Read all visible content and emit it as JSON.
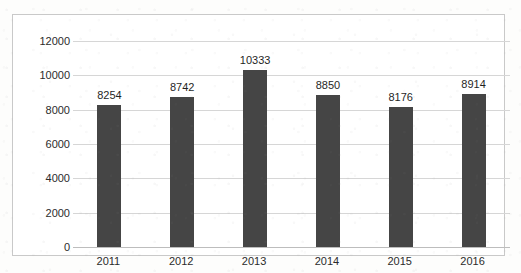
{
  "chart_data": {
    "type": "bar",
    "title": "",
    "subtitle": "",
    "xlabel": "",
    "ylabel": "",
    "categories": [
      "2011",
      "2012",
      "2013",
      "2014",
      "2015",
      "2016"
    ],
    "values": [
      8254,
      8742,
      10333,
      8850,
      8176,
      8914
    ],
    "series": [
      {
        "name": "",
        "values": [
          8254,
          8742,
          10333,
          8850,
          8176,
          8914
        ]
      }
    ],
    "data_labels": [
      "8254",
      "8742",
      "10333",
      "8850",
      "8176",
      "8914"
    ],
    "ylim": [
      0,
      12000
    ],
    "ytick_values": [
      0,
      2000,
      4000,
      6000,
      8000,
      10000,
      12000
    ],
    "ytick_labels": [
      "0",
      "2000",
      "4000",
      "6000",
      "8000",
      "10000",
      "12000"
    ],
    "grid": true,
    "legend": false,
    "legend_position": "none",
    "colors": {
      "bar": "#454545",
      "gridline": "#d6d6d6",
      "axis": "#bdbdbd",
      "border": "#c9c9c9",
      "plot_background": "#ffffff",
      "text": "#2b2b2b"
    }
  }
}
